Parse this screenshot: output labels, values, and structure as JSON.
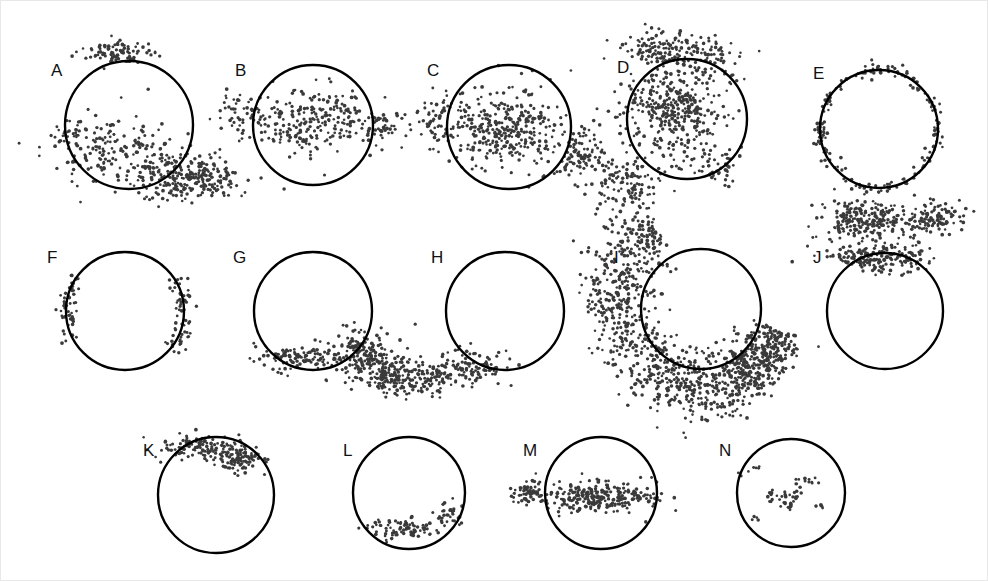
{
  "figure": {
    "width": 988,
    "height": 581,
    "background_color": "#ffffff",
    "dot_color": "#3a3a3a",
    "circle_stroke_color": "#000000",
    "label_color": "#111111",
    "panel_count": 14
  },
  "chart_data": {
    "type": "scatter",
    "title": "",
    "xlabel": "",
    "ylabel": "",
    "grid": false,
    "legend": "none",
    "panel_labels": [
      "A",
      "B",
      "C",
      "D",
      "E",
      "F",
      "G",
      "H",
      "I",
      "J",
      "K",
      "L",
      "M",
      "N"
    ],
    "panels": [
      {
        "label": "A",
        "label_x": 50,
        "label_y": 75,
        "circle": {
          "cx": 128,
          "cy": 124,
          "r": 64
        },
        "n_points": 560,
        "seed": 11,
        "clouds": [
          {
            "cx": 120,
            "cy": 52,
            "sx": 28,
            "sy": 11,
            "weight": 0.16
          },
          {
            "cx": 118,
            "cy": 150,
            "sx": 52,
            "sy": 28,
            "weight": 0.34
          },
          {
            "cx": 170,
            "cy": 178,
            "sx": 32,
            "sy": 18,
            "weight": 0.25
          },
          {
            "cx": 205,
            "cy": 176,
            "sx": 26,
            "sy": 16,
            "weight": 0.2
          },
          {
            "cx": 70,
            "cy": 132,
            "sx": 16,
            "sy": 14,
            "weight": 0.05
          }
        ]
      },
      {
        "label": "B",
        "label_x": 234,
        "label_y": 75,
        "circle": {
          "cx": 312,
          "cy": 124,
          "r": 60
        },
        "n_points": 330,
        "seed": 23,
        "clouds": [
          {
            "cx": 312,
            "cy": 122,
            "sx": 50,
            "sy": 28,
            "weight": 0.72
          },
          {
            "cx": 243,
            "cy": 116,
            "sx": 20,
            "sy": 17,
            "weight": 0.14
          },
          {
            "cx": 382,
            "cy": 126,
            "sx": 20,
            "sy": 15,
            "weight": 0.14
          }
        ]
      },
      {
        "label": "C",
        "label_x": 426,
        "label_y": 75,
        "circle": {
          "cx": 508,
          "cy": 126,
          "r": 62
        },
        "n_points": 600,
        "seed": 37,
        "clouds": [
          {
            "cx": 505,
            "cy": 128,
            "sx": 48,
            "sy": 32,
            "weight": 0.56
          },
          {
            "cx": 437,
            "cy": 118,
            "sx": 18,
            "sy": 15,
            "weight": 0.08
          },
          {
            "cx": 580,
            "cy": 155,
            "sx": 26,
            "sy": 20,
            "weight": 0.18
          },
          {
            "cx": 625,
            "cy": 185,
            "sx": 28,
            "sy": 19,
            "weight": 0.18
          }
        ]
      },
      {
        "label": "D",
        "label_x": 616,
        "label_y": 72,
        "circle": {
          "cx": 686,
          "cy": 118,
          "r": 60
        },
        "n_points": 620,
        "seed": 53,
        "clouds": [
          {
            "cx": 670,
            "cy": 110,
            "sx": 40,
            "sy": 36,
            "weight": 0.6
          },
          {
            "cx": 660,
            "cy": 48,
            "sx": 30,
            "sy": 14,
            "weight": 0.2
          },
          {
            "cx": 712,
            "cy": 60,
            "sx": 26,
            "sy": 18,
            "weight": 0.12
          },
          {
            "cx": 720,
            "cy": 165,
            "sx": 22,
            "sy": 16,
            "weight": 0.08
          }
        ]
      },
      {
        "label": "E",
        "label_x": 812,
        "label_y": 78,
        "circle": {
          "cx": 878,
          "cy": 128,
          "r": 59
        },
        "n_points": 190,
        "seed": 71,
        "ring": {
          "cx": 878,
          "cy": 128,
          "r": 59,
          "jitter": 7
        }
      },
      {
        "label": "F",
        "label_x": 46,
        "label_y": 262,
        "circle": {
          "cx": 124,
          "cy": 310,
          "r": 59
        },
        "n_points": 120,
        "seed": 89,
        "arcs": [
          {
            "cx": 124,
            "cy": 310,
            "r": 59,
            "a0": 150,
            "a1": 215,
            "jitter": 10,
            "weight": 0.45
          },
          {
            "cx": 124,
            "cy": 310,
            "r": 59,
            "a0": -35,
            "a1": 40,
            "jitter": 11,
            "weight": 0.55
          }
        ]
      },
      {
        "label": "G",
        "label_x": 232,
        "label_y": 262,
        "circle": {
          "cx": 312,
          "cy": 310,
          "r": 59
        },
        "n_points": 430,
        "seed": 101,
        "clouds": [
          {
            "cx": 300,
            "cy": 356,
            "sx": 36,
            "sy": 10,
            "weight": 0.26
          },
          {
            "cx": 362,
            "cy": 355,
            "sx": 24,
            "sy": 22,
            "weight": 0.4
          },
          {
            "cx": 392,
            "cy": 375,
            "sx": 22,
            "sy": 17,
            "weight": 0.34
          }
        ]
      },
      {
        "label": "H",
        "label_x": 430,
        "label_y": 262,
        "circle": {
          "cx": 504,
          "cy": 310,
          "r": 59
        },
        "n_points": 185,
        "seed": 127,
        "clouds": [
          {
            "cx": 470,
            "cy": 366,
            "sx": 26,
            "sy": 15,
            "weight": 0.58
          },
          {
            "cx": 430,
            "cy": 378,
            "sx": 18,
            "sy": 13,
            "weight": 0.42
          }
        ]
      },
      {
        "label": "I",
        "label_x": 613,
        "label_y": 262,
        "circle": {
          "cx": 700,
          "cy": 308,
          "r": 60
        },
        "n_points": 1150,
        "seed": 149,
        "arcs": [
          {
            "cx": 700,
            "cy": 300,
            "r": 86,
            "a0": 130,
            "a1": 240,
            "jitter": 34,
            "weight": 0.4
          },
          {
            "cx": 700,
            "cy": 300,
            "r": 86,
            "a0": 55,
            "a1": 130,
            "jitter": 30,
            "weight": 0.34
          },
          {
            "cx": 700,
            "cy": 300,
            "r": 86,
            "a0": 20,
            "a1": 60,
            "jitter": 26,
            "weight": 0.26
          }
        ]
      },
      {
        "label": "J",
        "label_x": 812,
        "label_y": 262,
        "circle": {
          "cx": 884,
          "cy": 310,
          "r": 58
        },
        "n_points": 520,
        "seed": 167,
        "clouds": [
          {
            "cx": 862,
            "cy": 218,
            "sx": 38,
            "sy": 16,
            "weight": 0.42
          },
          {
            "cx": 930,
            "cy": 216,
            "sx": 22,
            "sy": 14,
            "weight": 0.22
          },
          {
            "cx": 878,
            "cy": 256,
            "sx": 40,
            "sy": 12,
            "weight": 0.36
          }
        ]
      },
      {
        "label": "K",
        "label_x": 142,
        "label_y": 455,
        "circle": {
          "cx": 215,
          "cy": 494,
          "r": 58
        },
        "n_points": 210,
        "seed": 191,
        "clouds": [
          {
            "cx": 200,
            "cy": 446,
            "sx": 34,
            "sy": 10,
            "weight": 0.55
          },
          {
            "cx": 240,
            "cy": 458,
            "sx": 22,
            "sy": 11,
            "weight": 0.45
          }
        ]
      },
      {
        "label": "L",
        "label_x": 342,
        "label_y": 455,
        "circle": {
          "cx": 408,
          "cy": 492,
          "r": 56
        },
        "n_points": 110,
        "seed": 211,
        "clouds": [
          {
            "cx": 404,
            "cy": 528,
            "sx": 32,
            "sy": 8,
            "weight": 0.72
          },
          {
            "cx": 448,
            "cy": 512,
            "sx": 12,
            "sy": 10,
            "weight": 0.28
          }
        ]
      },
      {
        "label": "M",
        "label_x": 522,
        "label_y": 455,
        "circle": {
          "cx": 600,
          "cy": 492,
          "r": 56
        },
        "n_points": 330,
        "seed": 233,
        "clouds": [
          {
            "cx": 596,
            "cy": 496,
            "sx": 48,
            "sy": 13,
            "weight": 0.84
          },
          {
            "cx": 528,
            "cy": 490,
            "sx": 14,
            "sy": 8,
            "weight": 0.16
          }
        ]
      },
      {
        "label": "N",
        "label_x": 718,
        "label_y": 455,
        "circle": {
          "cx": 790,
          "cy": 492,
          "r": 54
        },
        "n_points": 58,
        "seed": 257,
        "clusters": [
          {
            "cx": 790,
            "cy": 490,
            "sx": 28,
            "sy": 22,
            "weight": 1.0,
            "clumped": true
          }
        ]
      }
    ]
  }
}
